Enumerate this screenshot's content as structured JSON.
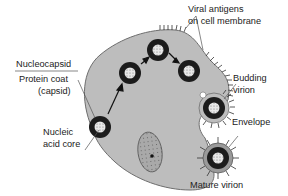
{
  "diagram": {
    "colors": {
      "cell_fill": "#bdbdbd",
      "cell_stroke": "#6e6e6e",
      "capsid": "#1c1c1c",
      "core": "#e6e6e6",
      "envelope": "#9a9a9a",
      "text": "#222222"
    },
    "labels": {
      "nucleocapsid": "Nucleocapsid",
      "protein_coat_1": "Protein coat",
      "protein_coat_2": "(capsid)",
      "nucleic_acid_1": "Nucleic",
      "nucleic_acid_2": "acid core",
      "viral_antigens_1": "Viral antigens",
      "viral_antigens_2": "on cell membrane",
      "budding_1": "Budding",
      "budding_2": "virion",
      "envelope": "Envelope",
      "mature_virion": "Mature virion"
    }
  }
}
